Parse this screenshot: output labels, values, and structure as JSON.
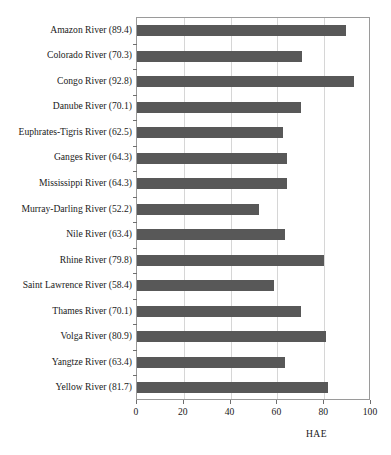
{
  "chart_data": {
    "type": "bar",
    "orientation": "horizontal",
    "title": "",
    "xlabel": "HAE",
    "ylabel": "",
    "xlim": [
      0,
      100
    ],
    "ylim": null,
    "grid": true,
    "legend": null,
    "xticks": [
      0,
      20,
      40,
      60,
      80,
      100
    ],
    "xtick_labels": [
      "0",
      "20",
      "40",
      "60",
      "80",
      "100"
    ],
    "bar_color": "#585858",
    "categories": [
      "Amazon River (89.4)",
      "Colorado River (70.3)",
      "Congo River (92.8)",
      "Danube River (70.1)",
      "Euphrates-Tigris River (62.5)",
      "Ganges River (64.3)",
      "Mississippi River (64.3)",
      "Murray-Darling River (52.2)",
      "Nile River (63.4)",
      "Rhine River (79.8)",
      "Saint Lawrence River (58.4)",
      "Thames River (70.1)",
      "Volga River (80.9)",
      "Yangtze River (63.4)",
      "Yellow River (81.7)"
    ],
    "values": [
      89.4,
      70.3,
      92.8,
      70.1,
      62.5,
      64.3,
      64.3,
      52.2,
      63.4,
      79.8,
      58.4,
      70.1,
      80.9,
      63.4,
      81.7
    ]
  }
}
